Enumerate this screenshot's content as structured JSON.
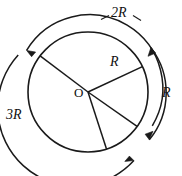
{
  "figure": {
    "kind": "geometry-diagram",
    "background_color": "#ffffff",
    "stroke_color": "#1a1a1a",
    "labels": {
      "centre": "O",
      "outer_arc": "3R",
      "middle_arc": "2R",
      "right_arc": "R",
      "inner_radius": "R"
    },
    "circle": {
      "centre_x": 88,
      "centre_y": 92,
      "radius": 60
    },
    "arcs": [
      {
        "name": "middle-arc",
        "label": "2R",
        "radius": 68,
        "arrow_ends": [
          "start"
        ],
        "direction": "counterclockwise"
      },
      {
        "name": "outer-arc",
        "label": "3R",
        "radius": 78,
        "arrow_ends": [
          "end"
        ],
        "direction": "clockwise"
      },
      {
        "name": "right-arc",
        "label": "R",
        "radius": 74,
        "arrow_ends": [
          "start",
          "end"
        ],
        "direction": "double"
      }
    ],
    "radii": [
      {
        "name": "radius-upper-left",
        "angle_deg": 143
      },
      {
        "name": "radius-upper-right",
        "angle_deg": 25,
        "label": "R"
      },
      {
        "name": "radius-lower-right",
        "angle_deg": -35
      },
      {
        "name": "radius-lower",
        "angle_deg": -72
      }
    ]
  }
}
